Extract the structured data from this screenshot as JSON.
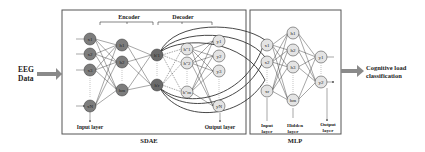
{
  "input": {
    "label_line1": "EEG",
    "label_line2": "Data"
  },
  "output": {
    "label_line1": "Cognitive load",
    "label_line2": "classification"
  },
  "sdae": {
    "title": "SDAE",
    "encoder_label": "Encoder",
    "decoder_label": "Decoder",
    "input_layer_label": "Input layer",
    "output_layer_label": "Output layer",
    "input_nodes": [
      "x1",
      "x2",
      "x3",
      "xN"
    ],
    "hidden1_nodes": [
      "h1",
      "h2",
      "hm"
    ],
    "code_nodes": [
      "h'1",
      "h'r"
    ],
    "decoded_nodes": [
      "h\"1",
      "h\"2",
      "h\"m"
    ],
    "output_nodes": [
      "y1",
      "y2",
      "y3",
      "yN"
    ]
  },
  "mlp": {
    "title": "MLP",
    "input_layer_label": [
      "Input",
      "layer"
    ],
    "hidden_layer_label": [
      "Hidden",
      "layer"
    ],
    "output_layer_label": [
      "Output",
      "layer"
    ],
    "input_nodes": [
      "x1",
      "x2",
      "xr"
    ],
    "hidden_nodes": [
      "h1",
      "h2",
      "h3",
      "hm"
    ],
    "output_nodes": [
      "y1",
      "y2"
    ]
  },
  "colors": {
    "dark_node": "#7d7d7d",
    "light_node": "#e4e4e4",
    "arrow": "#8a8a8a",
    "border": "#555555"
  }
}
